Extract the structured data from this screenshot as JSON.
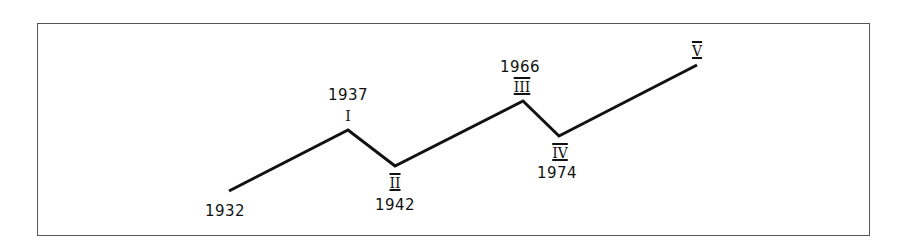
{
  "chart_data": {
    "type": "line",
    "title": "",
    "points": [
      {
        "id": "start",
        "roman": "",
        "year": "1932",
        "x": 229,
        "y": 191
      },
      {
        "id": "I",
        "roman": "I",
        "year": "1937",
        "x": 348,
        "y": 130
      },
      {
        "id": "II",
        "roman": "II",
        "year": "1942",
        "x": 395,
        "y": 166
      },
      {
        "id": "III",
        "roman": "III",
        "year": "1966",
        "x": 523,
        "y": 101
      },
      {
        "id": "IV",
        "roman": "IV",
        "year": "1974",
        "x": 559,
        "y": 136
      },
      {
        "id": "V",
        "roman": "V",
        "year": "",
        "x": 697,
        "y": 65
      }
    ],
    "line_color": "#111111",
    "frame": true,
    "grid": false
  },
  "labels": {
    "start_year": "1932",
    "i_roman": "I",
    "i_year": "1937",
    "ii_roman": "II",
    "ii_year": "1942",
    "iii_roman": "III",
    "iii_year": "1966",
    "iv_roman": "IV",
    "iv_year": "1974",
    "v_roman": "V"
  }
}
